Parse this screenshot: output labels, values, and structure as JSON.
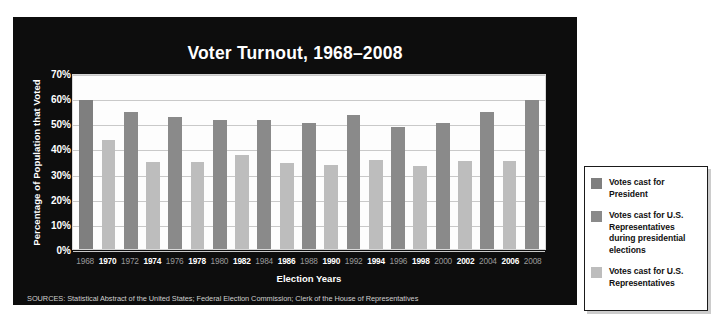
{
  "chart_data": {
    "type": "bar",
    "title": "Voter Turnout, 1968–2008",
    "xlabel": "Election Years",
    "ylabel": "Percentage of Population that Voted",
    "ylim": [
      0,
      70
    ],
    "ytick_labels": [
      "70%",
      "60%",
      "50%",
      "40%",
      "30%",
      "20%",
      "10%",
      "0%"
    ],
    "ytick_values": [
      70,
      60,
      50,
      40,
      30,
      20,
      10,
      0
    ],
    "grid": true,
    "legend_position": "right",
    "categories": [
      "1968",
      "1970",
      "1972",
      "1974",
      "1976",
      "1978",
      "1980",
      "1982",
      "1984",
      "1986",
      "1988",
      "1990",
      "1992",
      "1994",
      "1996",
      "1998",
      "2000",
      "2002",
      "2004",
      "2006",
      "2008"
    ],
    "values": [
      60,
      44,
      55,
      35,
      53,
      35,
      52,
      38,
      52,
      34.5,
      50.5,
      34,
      54,
      36,
      49,
      33.5,
      50.5,
      35.5,
      55,
      35.5,
      60
    ],
    "bar_kinds": [
      "pres",
      "midterm",
      "presrep",
      "midterm",
      "presrep",
      "midterm",
      "presrep",
      "midterm",
      "presrep",
      "midterm",
      "presrep",
      "midterm",
      "presrep",
      "midterm",
      "presrep",
      "midterm",
      "presrep",
      "midterm",
      "presrep",
      "midterm",
      "presrep"
    ],
    "label_styles": [
      "light",
      "bold",
      "light",
      "bold",
      "light",
      "bold",
      "light",
      "bold",
      "light",
      "bold",
      "light",
      "bold",
      "light",
      "bold",
      "light",
      "bold",
      "light",
      "bold",
      "light",
      "bold",
      "light"
    ],
    "colors": {
      "president": "#7f7f7f",
      "representatives_presidential": "#8a8a8a",
      "representatives": "#bdbdbd",
      "panel_background": "#0d0d0d",
      "plot_background": "#fdfdfd",
      "gridline": "#c9c9c9"
    },
    "legend": [
      {
        "label": "Votes cast for President",
        "kind": "pres"
      },
      {
        "label": "Votes cast for U.S. Representatives during presidential elections",
        "kind": "presrep"
      },
      {
        "label": "Votes cast for U.S. Representatives",
        "kind": "midterm"
      }
    ]
  },
  "sources": "SOURCES: Statistical Abstract of the United States; Federal Election Commission; Clerk of the House of Representatives"
}
